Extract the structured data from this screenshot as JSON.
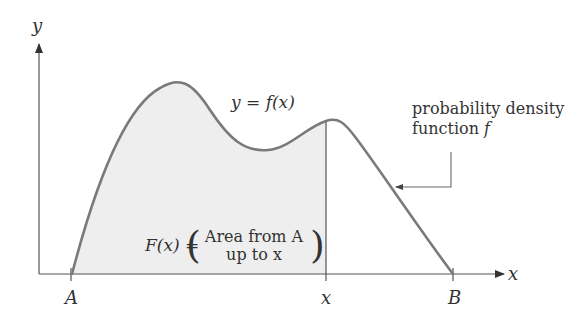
{
  "diagram": {
    "type": "probability density function with cumulative area",
    "axes": {
      "y_label": "y",
      "x_label": "x"
    },
    "x_ticks": [
      {
        "id": "A",
        "label": "A"
      },
      {
        "id": "x",
        "label": "x"
      },
      {
        "id": "B",
        "label": "B"
      }
    ],
    "curve_label": "y = f(x)",
    "callout": {
      "line1": "probability density",
      "line2_prefix": "function ",
      "line2_symbol": "f"
    },
    "area_formula": {
      "lhs": "F(x) = ",
      "line1": "Area from A",
      "line2": "up to x"
    },
    "colors": {
      "curve": "#7a7a7a",
      "axis": "#555555",
      "fill": "#eeeeee",
      "text": "#333333"
    }
  }
}
